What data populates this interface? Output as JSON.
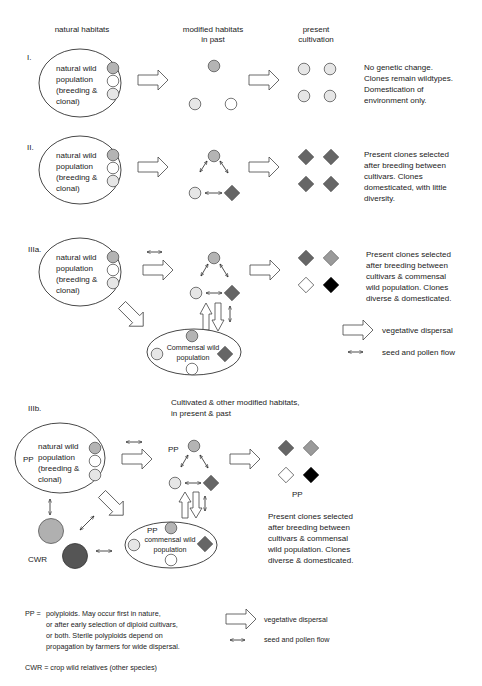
{
  "colors": {
    "medium_gray": "#b4b4b4",
    "light_gray": "#e6e6e6",
    "white": "#ffffff",
    "dark_gray": "#666666",
    "mid_diamond": "#9a9a9a",
    "black": "#000000",
    "cwr_light": "#b0b0b0",
    "cwr_dark": "#555555"
  },
  "headers": {
    "natural": "natural habitats",
    "modified_1": "modified habitats",
    "modified_2": "in past",
    "present_1": "present",
    "present_2": "cultivation"
  },
  "wild_pop": {
    "line1": "natural wild",
    "line2": "population",
    "line3": "(breeding &",
    "line4": "clonal)"
  },
  "scenarios": {
    "I": {
      "label": "I.",
      "desc": [
        "No genetic change.",
        "Clones remain wildtypes.",
        "Domestication of",
        "environment only."
      ]
    },
    "II": {
      "label": "II.",
      "desc": [
        "Present clones selected",
        "after breeding between",
        "cultivars. Clones",
        "domesticated, with little",
        "diversity."
      ]
    },
    "IIIa": {
      "label": "IIIa.",
      "desc": [
        "Present clones selected",
        "after breeding between",
        "cultivars & commensal",
        "wild population. Clones",
        "diverse & domesticated."
      ],
      "commensal_1": "Commensal wild",
      "commensal_2": "population"
    },
    "IIIb": {
      "label": "IIIb.",
      "header_1": "Cultivated & other modified habitats,",
      "header_2": "in present & past",
      "pp": "PP",
      "cwr": "CWR",
      "commensal_1": "commensal wild",
      "commensal_2": "population",
      "desc": [
        "Present clones selected",
        "after breeding between",
        "cultivars & commensal",
        "wild population. Clones",
        "diverse & domesticated."
      ]
    }
  },
  "legend": {
    "vegetative": "vegetative dispersal",
    "seed_pollen": "seed and pollen flow"
  },
  "footnotes": {
    "pp_key": "PP =",
    "pp_lines": [
      "polyploids. May occur first in nature,",
      "or after early selection of diploid cultivars,",
      "or both. Sterile polyploids depend on",
      "propagation by farmers for wide dispersal."
    ],
    "cwr": "CWR = crop wild relatives (other species)"
  }
}
